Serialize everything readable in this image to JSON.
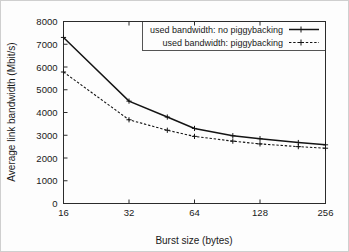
{
  "chart_data": {
    "type": "line",
    "title": "",
    "xlabel": "Burst size (bytes)",
    "ylabel": "Average link bandwidth (Mbit/s)",
    "x": [
      16,
      32,
      48,
      64,
      96,
      128,
      192,
      256
    ],
    "xticks": [
      "16",
      "32",
      "64",
      "128",
      "256"
    ],
    "xtick_values": [
      16,
      32,
      64,
      128,
      256
    ],
    "xscale": "log2",
    "xlim": [
      16,
      256
    ],
    "yticks": [
      "0",
      "1000",
      "2000",
      "3000",
      "4000",
      "5000",
      "6000",
      "7000",
      "8000"
    ],
    "ytick_values": [
      0,
      1000,
      2000,
      3000,
      4000,
      5000,
      6000,
      7000,
      8000
    ],
    "ylim": [
      0,
      8000
    ],
    "grid": false,
    "legend_position": "top-right",
    "series": [
      {
        "name": "used bandwidth: no piggybacking",
        "style": "solid",
        "marker": "cross",
        "color": "#141414",
        "values": [
          7300,
          4500,
          3800,
          3300,
          2980,
          2850,
          2680,
          2580
        ]
      },
      {
        "name": "used bandwidth: piggybacking",
        "style": "dashed",
        "marker": "cross",
        "color": "#141414",
        "values": [
          5780,
          3680,
          3220,
          2950,
          2740,
          2620,
          2500,
          2430
        ]
      }
    ]
  },
  "legend": {
    "entries": [
      {
        "label": "used bandwidth: no piggybacking"
      },
      {
        "label": "used bandwidth: piggybacking"
      }
    ]
  }
}
